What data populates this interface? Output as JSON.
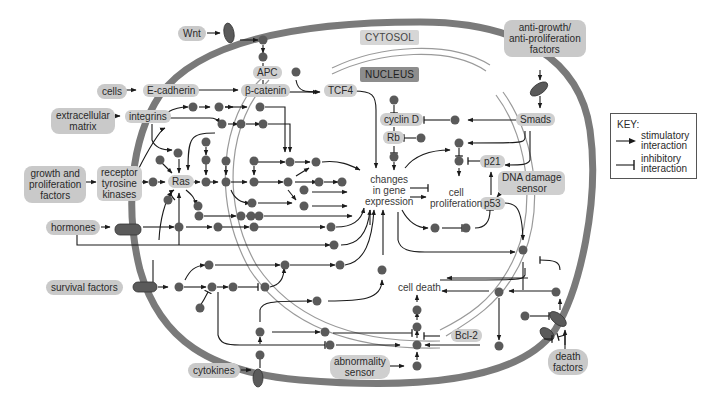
{
  "compartments": {
    "cytosol": "CYTOSOL",
    "nucleus": "NUCLEUS"
  },
  "external_signals": {
    "wnt": "Wnt",
    "cells": "cells",
    "extracellular_matrix": "extracellular\nmatrix",
    "growth_factors": "growth and\nproliferation\nfactors",
    "hormones": "hormones",
    "survival_factors": "survival factors",
    "cytokines": "cytokines",
    "anti_growth": "anti-growth/\nanti-proliferation\nfactors",
    "death_factors": "death\nfactors"
  },
  "proteins": {
    "apc": "APC",
    "e_cadherin": "E-cadherin",
    "beta_catenin": "β-catenin",
    "tcf4": "TCF4",
    "integrins": "integrins",
    "rtk": "receptor\ntyrosine\nkinases",
    "ras": "Ras",
    "cyclin_d": "cyclin D",
    "rb": "Rb",
    "smads": "Smads",
    "p21": "p21",
    "p53": "p53",
    "dna_damage_sensor": "DNA damage\nsensor",
    "bcl2": "Bcl-2",
    "abnormality_sensor": "abnormality\nsensor"
  },
  "outcomes": {
    "gene_expression": "changes\nin gene\nexpression",
    "cell_proliferation": "cell\nproliferation",
    "cell_death": "cell death"
  },
  "key": {
    "title": "KEY:",
    "stimulatory": "stimulatory\ninteraction",
    "inhibitory": "inhibitory\ninteraction"
  },
  "colors": {
    "membrane": "#7a7a7a",
    "nuclear_envelope": "#9a9a9a",
    "node": "#5a5a5a",
    "label_bg": "#c9c9c9",
    "arrow": "#1a1a1a"
  }
}
